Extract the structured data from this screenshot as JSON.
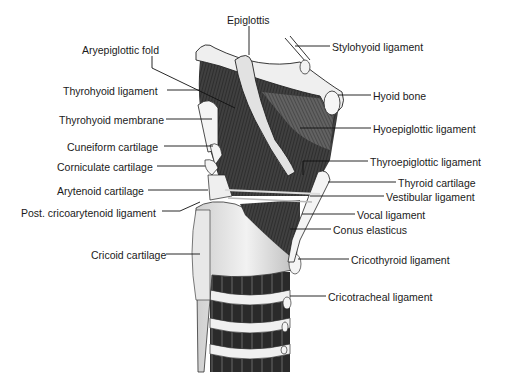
{
  "figure": {
    "type": "anatomical-illustration",
    "labels_left": [
      {
        "text": "Aryepiglottic fold",
        "x": 82,
        "y": 44
      },
      {
        "text": "Thyrohyoid ligament",
        "x": 63,
        "y": 85
      },
      {
        "text": "Thyrohyoid membrane",
        "x": 59,
        "y": 114
      },
      {
        "text": "Cuneiform cartilage",
        "x": 67,
        "y": 141
      },
      {
        "text": "Corniculate cartilage",
        "x": 57,
        "y": 161
      },
      {
        "text": "Arytenoid cartilage",
        "x": 57,
        "y": 185
      },
      {
        "text": "Post. cricoarytenoid ligament",
        "x": 21,
        "y": 207
      },
      {
        "text": "Cricoid cartilage",
        "x": 91,
        "y": 249
      }
    ],
    "labels_right": [
      {
        "text": "Epiglottis",
        "x": 227,
        "y": 14
      },
      {
        "text": "Stylohyoid ligament",
        "x": 332,
        "y": 41
      },
      {
        "text": "Hyoid bone",
        "x": 373,
        "y": 90
      },
      {
        "text": "Hyoepiglottic ligament",
        "x": 373,
        "y": 123
      },
      {
        "text": "Thyroepiglottic ligament",
        "x": 370,
        "y": 156
      },
      {
        "text": "Thyroid cartilage",
        "x": 398,
        "y": 177
      },
      {
        "text": "Vestibular ligament",
        "x": 386,
        "y": 191
      },
      {
        "text": "Vocal ligament",
        "x": 357,
        "y": 209
      },
      {
        "text": "Conus elasticus",
        "x": 333,
        "y": 224
      },
      {
        "text": "Cricothyroid ligament",
        "x": 351,
        "y": 254
      },
      {
        "text": "Cricotracheal ligament",
        "x": 328,
        "y": 291
      }
    ]
  }
}
